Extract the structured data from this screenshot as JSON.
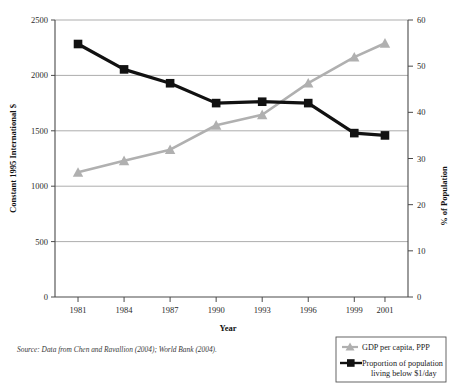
{
  "chart_data": {
    "type": "line",
    "title": "",
    "xlabel": "Year",
    "ylabel": "Constant 1995 International $",
    "ylabel_right": "% of Population",
    "x": [
      1981,
      1984,
      1987,
      1990,
      1993,
      1996,
      1999,
      2001
    ],
    "xtick_labels": [
      "1981",
      "1984",
      "1987",
      "1990",
      "1993",
      "1996",
      "1999",
      "2001"
    ],
    "xlim": [
      1979.5,
      2002.5
    ],
    "ylim_left": [
      0,
      2500
    ],
    "ylim_right": [
      0,
      60
    ],
    "ytick_labels_left": [
      "0",
      "500",
      "1000",
      "1500",
      "2000",
      "2500"
    ],
    "ytick_values_left": [
      0,
      500,
      1000,
      1500,
      2000,
      2500
    ],
    "ytick_labels_right": [
      "0",
      "10",
      "20",
      "30",
      "40",
      "50",
      "60"
    ],
    "ytick_values_right": [
      0,
      10,
      20,
      30,
      40,
      50,
      60
    ],
    "grid": true,
    "legend_position": "bottom-right",
    "series": [
      {
        "name": "GDP per capita, PPP",
        "axis": "left",
        "marker": "triangle",
        "color": "#b0b0b0",
        "values": [
          1125,
          1230,
          1330,
          1550,
          1645,
          1930,
          2165,
          2290
        ]
      },
      {
        "name": "Proportion of population living below $1/day",
        "axis": "right",
        "marker": "square",
        "color": "#111111",
        "values": [
          54.8,
          49.3,
          46.3,
          42.0,
          42.3,
          42.0,
          35.5,
          35.0
        ]
      }
    ],
    "legend": [
      {
        "label": "GDP per capita, PPP",
        "marker": "triangle",
        "color": "#b0b0b0"
      },
      {
        "label": "Proportion of population",
        "label2": "living below $1/day",
        "marker": "square",
        "color": "#111111"
      }
    ],
    "source": "Source: Data from Chen and Ravallion (2004); World Bank (2004)."
  }
}
